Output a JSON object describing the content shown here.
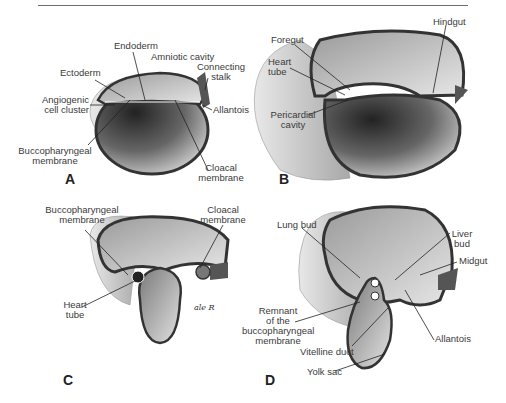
{
  "figure": {
    "panels": [
      {
        "letter": "A",
        "labels": {
          "endoderm": "Endoderm",
          "amniotic_cavity": "Amniotic cavity",
          "ectoderm": "Ectoderm",
          "connecting_stalk_1": "Connecting",
          "connecting_stalk_2": "stalk",
          "angiogenic_1": "Angiogenic",
          "angiogenic_2": "cell cluster",
          "allantois": "Allantois",
          "bucco_1": "Buccopharyngeal",
          "bucco_2": "membrane",
          "cloacal_1": "Cloacal",
          "cloacal_2": "membrane"
        }
      },
      {
        "letter": "B",
        "labels": {
          "hindgut": "Hindgut",
          "foregut": "Foregut",
          "heart_1": "Heart",
          "heart_2": "tube",
          "pericardial_1": "Pericardial",
          "pericardial_2": "cavity"
        }
      },
      {
        "letter": "C",
        "labels": {
          "bucco_1": "Buccopharyngeal",
          "bucco_2": "membrane",
          "cloacal_1": "Cloacal",
          "cloacal_2": "membrane",
          "heart_1": "Heart",
          "heart_2": "tube"
        },
        "signature": "ale R"
      },
      {
        "letter": "D",
        "labels": {
          "lung_bud": "Lung bud",
          "liver_1": "Liver",
          "liver_2": "bud",
          "midgut": "Midgut",
          "remnant_1": "Remnant",
          "remnant_2": "of the",
          "remnant_3": "buccopharyngeal",
          "remnant_4": "membrane",
          "allantois": "Allantois",
          "vitelline_duct": "Vitelline duct",
          "yolk_sac": "Yolk sac"
        }
      }
    ]
  }
}
